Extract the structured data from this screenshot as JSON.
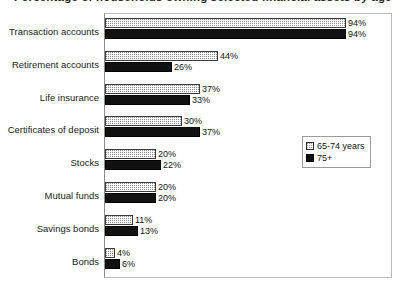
{
  "chart_data": {
    "type": "bar",
    "orientation": "horizontal",
    "title": "Percentage of households owning selected financial assets by age",
    "subtitle": "",
    "xlabel": "",
    "ylabel": "",
    "xlim": [
      0,
      100
    ],
    "grid": false,
    "legend_position": "middle-right",
    "value_suffix": "%",
    "categories": [
      "Transaction accounts",
      "Retirement  accounts",
      "Life insurance",
      "Certificates of deposit",
      "Stocks",
      "Mutual funds",
      "Savings bonds",
      "Bonds"
    ],
    "series": [
      {
        "name": "65-74 years",
        "pattern": "hatched",
        "values": [
          94,
          44,
          37,
          30,
          20,
          20,
          11,
          4
        ],
        "labels": [
          "94%",
          "44%",
          "37%",
          "30%",
          "20%",
          "20%",
          "11%",
          "4%"
        ]
      },
      {
        "name": "75+",
        "pattern": "solid-black",
        "values": [
          94,
          26,
          33,
          37,
          22,
          20,
          13,
          6
        ],
        "labels": [
          "94%",
          "26%",
          "33%",
          "37%",
          "22%",
          "20%",
          "13%",
          "6%"
        ]
      }
    ]
  },
  "legend": {
    "entries": [
      {
        "label": "65-74 years"
      },
      {
        "label": "75+"
      }
    ]
  },
  "colors": {
    "series_65_74": "#8e8e8e",
    "series_75_plus": "#111111",
    "frame": "#b9b9b9",
    "text": "#141414",
    "background": "#ffffff"
  }
}
